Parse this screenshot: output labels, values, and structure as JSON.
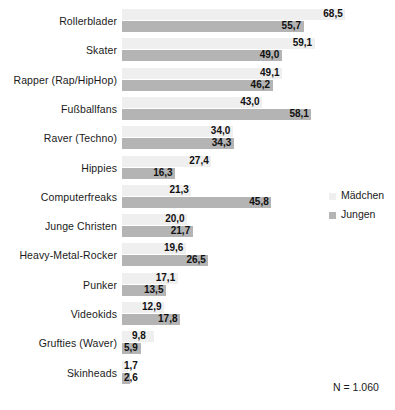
{
  "chart_data": {
    "type": "bar",
    "orientation": "horizontal",
    "title": "",
    "subtitle": "",
    "xlabel": "",
    "ylabel": "",
    "grid": false,
    "xlim": [
      0,
      68.5
    ],
    "legend_position": "right-middle",
    "categories": [
      "Rollerblader",
      "Skater",
      "Rapper (Rap/HipHop)",
      "Fußballfans",
      "Raver (Techno)",
      "Hippies",
      "Computerfreaks",
      "Junge Christen",
      "Heavy-Metal-Rocker",
      "Punker",
      "Videokids",
      "Grufties (Waver)",
      "Skinheads"
    ],
    "series": [
      {
        "name": "Mädchen",
        "color": "#efefef",
        "values": [
          68.5,
          59.1,
          49.1,
          43.0,
          34.0,
          27.4,
          21.3,
          20.0,
          19.6,
          17.1,
          12.9,
          9.8,
          1.7
        ],
        "labels": [
          "68,5",
          "59,1",
          "49,1",
          "43,0",
          "34,0",
          "27,4",
          "21,3",
          "20,0",
          "19,6",
          "17,1",
          "12,9",
          "9,8",
          "1,7"
        ]
      },
      {
        "name": "Jungen",
        "color": "#b4b4b4",
        "values": [
          55.7,
          49.0,
          46.2,
          58.1,
          34.3,
          16.3,
          45.8,
          21.7,
          26.5,
          13.5,
          17.8,
          5.9,
          2.6
        ],
        "labels": [
          "55,7",
          "49,0",
          "46,2",
          "58,1",
          "34,3",
          "16,3",
          "45,8",
          "21,7",
          "26,5",
          "13,5",
          "17,8",
          "5,9",
          "2,6"
        ]
      }
    ],
    "annotations": [
      {
        "name": "sample-size",
        "text": "N = 1.060"
      }
    ]
  },
  "legend": {
    "items": [
      {
        "label": "Mädchen",
        "color": "#efefef"
      },
      {
        "label": "Jungen",
        "color": "#b4b4b4"
      }
    ]
  },
  "note": {
    "text": "N = 1.060"
  }
}
